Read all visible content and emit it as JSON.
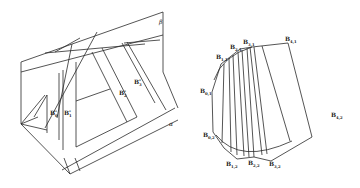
{
  "left_figure": {
    "plane_labels": {
      "alpha": "α",
      "beta": "β"
    },
    "strip_labels": [
      {
        "base": "B",
        "sup": "*",
        "sub": "0",
        "text": "B₀*"
      },
      {
        "base": "B",
        "sup": "*",
        "sub": "1",
        "text": "B₁*"
      },
      {
        "base": "B",
        "sup": "*",
        "sub": "2",
        "text": "B₂*"
      },
      {
        "base": "B",
        "sup": "*",
        "sub": "3",
        "text": "B₃*"
      }
    ]
  },
  "right_figure": {
    "vertex_labels": [
      {
        "id": "B41",
        "base": "B",
        "sub": "4,1"
      },
      {
        "id": "B31",
        "base": "B",
        "sub": "3,1"
      },
      {
        "id": "B21",
        "base": "B",
        "sub": "2,1"
      },
      {
        "id": "B11",
        "base": "B",
        "sub": "1,1"
      },
      {
        "id": "B01",
        "base": "B",
        "sub": "0,1"
      },
      {
        "id": "B02",
        "base": "B",
        "sub": "0,2"
      },
      {
        "id": "B12",
        "base": "B",
        "sub": "1,2"
      },
      {
        "id": "B22",
        "base": "B",
        "sub": "2,2"
      },
      {
        "id": "B32",
        "base": "B",
        "sub": "3,2"
      },
      {
        "id": "B42",
        "base": "B",
        "sub": "4,2"
      }
    ]
  },
  "colors": {
    "line": "#2a2a2a",
    "background": "#ffffff"
  }
}
